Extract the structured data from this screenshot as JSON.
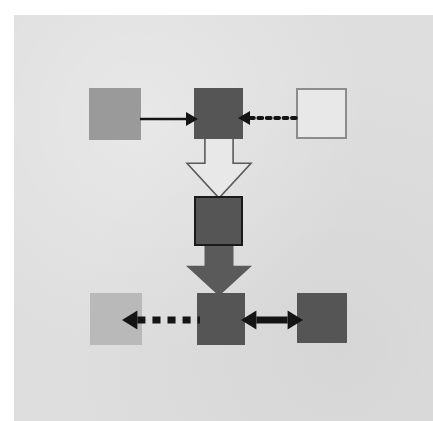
{
  "figure": {
    "kind": "block-flow-diagram",
    "title": "",
    "canvas": {
      "page_background": "#ffffff",
      "diagram_background": "#dedede",
      "width": 433,
      "height": 421
    }
  },
  "palette": {
    "medium_gray": "#9a9a9a",
    "dark_gray": "#555555",
    "light_gray": "#b9b9b9",
    "white_fill": "#e8e8e8",
    "outline_gray": "#8c8c8c",
    "black": "#141414"
  },
  "nodes": [
    {
      "id": "top-left",
      "name": "source-block",
      "label": "",
      "shape": "square",
      "fill": "#9a9a9a",
      "stroke": "none",
      "x": 89,
      "y": 88,
      "width": 52,
      "height": 52
    },
    {
      "id": "top-center",
      "name": "merge-block",
      "label": "",
      "shape": "square",
      "fill": "#555555",
      "stroke": "none",
      "x": 194,
      "y": 88,
      "width": 49,
      "height": 51
    },
    {
      "id": "top-right",
      "name": "empty-block",
      "label": "",
      "shape": "square",
      "fill": "#e8e8e8",
      "stroke": "#8c8c8c",
      "x": 296,
      "y": 88,
      "width": 51,
      "height": 51
    },
    {
      "id": "middle-center",
      "name": "process-block",
      "label": "",
      "shape": "square",
      "fill": "#555555",
      "stroke": "#1a1a1a",
      "x": 194,
      "y": 196,
      "width": 49,
      "height": 50
    },
    {
      "id": "bottom-left",
      "name": "output-block-left",
      "label": "",
      "shape": "square",
      "fill": "#b9b9b9",
      "stroke": "none",
      "x": 90,
      "y": 293,
      "width": 52,
      "height": 52
    },
    {
      "id": "bottom-center",
      "name": "hub-block",
      "label": "",
      "shape": "square",
      "fill": "#555555",
      "stroke": "none",
      "x": 197,
      "y": 293,
      "width": 48,
      "height": 52
    },
    {
      "id": "bottom-right",
      "name": "output-block-right",
      "label": "",
      "shape": "square",
      "fill": "#555555",
      "stroke": "none",
      "x": 297,
      "y": 293,
      "width": 50,
      "height": 50
    }
  ],
  "edges": [
    {
      "id": "edge-tl-tc",
      "name": "solid-right-arrow-top",
      "label": "",
      "style": "solid",
      "color": "#141414",
      "direction": "right",
      "heads": 1,
      "from": "top-left",
      "to": "top-center",
      "x": 140,
      "y": 106,
      "width": 58,
      "height": 26,
      "line_thickness": 2.4
    },
    {
      "id": "edge-tr-tc",
      "name": "dotted-left-arrow-top",
      "label": "",
      "style": "dotted",
      "color": "#141414",
      "direction": "left",
      "heads": 1,
      "from": "top-right",
      "to": "top-center",
      "x": 238,
      "y": 104,
      "width": 62,
      "height": 28,
      "line_thickness": 4
    },
    {
      "id": "edge-tc-mc",
      "name": "hollow-down-block-arrow",
      "label": "",
      "style": "hollow-block",
      "color": "#e8e8e8",
      "stroke": "#5a5a5a",
      "direction": "down",
      "heads": 1,
      "from": "top-center",
      "to": "middle-center",
      "x": 187,
      "y": 138,
      "width": 64,
      "height": 60
    },
    {
      "id": "edge-mc-bc",
      "name": "filled-down-block-arrow",
      "label": "",
      "style": "filled-block",
      "color": "#5a5a5a",
      "stroke": "none",
      "direction": "down",
      "heads": 1,
      "from": "middle-center",
      "to": "bottom-center",
      "x": 186,
      "y": 244,
      "width": 66,
      "height": 52
    },
    {
      "id": "edge-bc-bl",
      "name": "dashed-left-arrow-bottom",
      "label": "",
      "style": "dashed",
      "color": "#141414",
      "direction": "left",
      "heads": 1,
      "from": "bottom-center",
      "to": "bottom-left",
      "x": 122,
      "y": 306,
      "width": 78,
      "height": 28,
      "line_thickness": 7
    },
    {
      "id": "edge-bc-br",
      "name": "solid-double-arrow-bottom",
      "label": "",
      "style": "solid",
      "color": "#141414",
      "direction": "both",
      "heads": 2,
      "from": "bottom-center",
      "to": "bottom-right",
      "x": 241,
      "y": 306,
      "width": 62,
      "height": 28,
      "line_thickness": 7
    }
  ]
}
